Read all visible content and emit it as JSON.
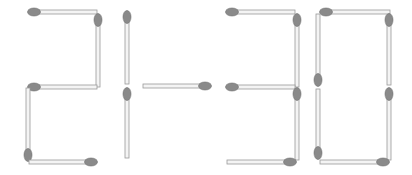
{
  "puzzle": {
    "equation_shown": "21-30",
    "colors": {
      "background": "#ffffff",
      "stick_fill": "#f4f4f4",
      "stick_edge": "#9a9a9a",
      "head_fill": "#8a8a8a",
      "head_edge": "#6e6e6e"
    },
    "digits": [
      {
        "label": "2",
        "matches": [
          {
            "id": "d2-top",
            "orient": "h",
            "x1": 34,
            "x2": 97,
            "y": 12,
            "head": "start"
          },
          {
            "id": "d2-ur",
            "orient": "v",
            "x": 98,
            "y1": 20,
            "y2": 87,
            "head": "start"
          },
          {
            "id": "d2-mid",
            "orient": "h",
            "x1": 34,
            "x2": 97,
            "y": 87,
            "head": "start"
          },
          {
            "id": "d2-ll",
            "orient": "v",
            "x": 28,
            "y1": 88,
            "y2": 155,
            "head": "end"
          },
          {
            "id": "d2-bottom",
            "orient": "h",
            "x1": 29,
            "x2": 91,
            "y": 162,
            "head": "end"
          }
        ]
      },
      {
        "label": "1",
        "matches": [
          {
            "id": "d1-upper",
            "orient": "v",
            "x": 127,
            "y1": 17,
            "y2": 84,
            "head": "start"
          },
          {
            "id": "d1-lower",
            "orient": "v",
            "x": 127,
            "y1": 94,
            "y2": 158,
            "head": "start"
          }
        ]
      },
      {
        "label": "-",
        "matches": [
          {
            "id": "minus",
            "orient": "h",
            "x1": 143,
            "x2": 205,
            "y": 86,
            "head": "end"
          }
        ]
      },
      {
        "label": "3",
        "matches": [
          {
            "id": "d3-top",
            "orient": "h",
            "x1": 232,
            "x2": 295,
            "y": 12,
            "head": "start"
          },
          {
            "id": "d3-ur",
            "orient": "v",
            "x": 297,
            "y1": 20,
            "y2": 87,
            "head": "start"
          },
          {
            "id": "d3-mid",
            "orient": "h",
            "x1": 232,
            "x2": 295,
            "y": 87,
            "head": "start"
          },
          {
            "id": "d3-lr",
            "orient": "v",
            "x": 297,
            "y1": 94,
            "y2": 160,
            "head": "start"
          },
          {
            "id": "d3-bottom",
            "orient": "h",
            "x1": 227,
            "x2": 290,
            "y": 162,
            "head": "end"
          }
        ]
      },
      {
        "label": "0",
        "matches": [
          {
            "id": "d0-top",
            "orient": "h",
            "x1": 326,
            "x2": 390,
            "y": 12,
            "head": "start"
          },
          {
            "id": "d0-ul",
            "orient": "v",
            "x": 318,
            "y1": 14,
            "y2": 80,
            "head": "end"
          },
          {
            "id": "d0-ur",
            "orient": "v",
            "x": 389,
            "y1": 20,
            "y2": 85,
            "head": "start"
          },
          {
            "id": "d0-ll",
            "orient": "v",
            "x": 318,
            "y1": 89,
            "y2": 153,
            "head": "end"
          },
          {
            "id": "d0-lr",
            "orient": "v",
            "x": 389,
            "y1": 94,
            "y2": 160,
            "head": "start"
          },
          {
            "id": "d0-bottom",
            "orient": "h",
            "x1": 320,
            "x2": 383,
            "y": 162,
            "head": "end"
          }
        ]
      }
    ]
  }
}
